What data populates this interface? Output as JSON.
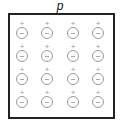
{
  "title": "p",
  "grid": {
    "rows": 4,
    "cols": 4,
    "positive_label": "+",
    "ion_label": "−"
  }
}
